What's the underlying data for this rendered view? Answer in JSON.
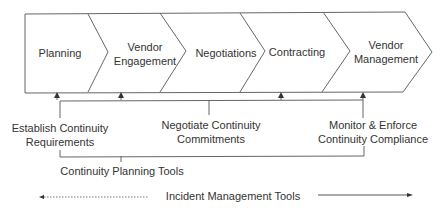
{
  "stages": [
    {
      "label_line1": "Planning",
      "label_line2": ""
    },
    {
      "label_line1": "Vendor",
      "label_line2": "Engagement"
    },
    {
      "label_line1": "Negotiations",
      "label_line2": ""
    },
    {
      "label_line1": "Contracting",
      "label_line2": ""
    },
    {
      "label_line1": "Vendor",
      "label_line2": "Management"
    }
  ],
  "activities": [
    {
      "line1": "Establish Continuity",
      "line2": "Requirements"
    },
    {
      "line1": "Negotiate Continuity",
      "line2": "Commitments"
    },
    {
      "line1": "Monitor & Enforce",
      "line2": "Continuity Compliance"
    }
  ],
  "bracket_label": "Continuity Planning Tools",
  "incident_label": "Incident Management Tools",
  "colors": {
    "stroke": "#555555",
    "text": "#333333",
    "background": "#ffffff"
  }
}
